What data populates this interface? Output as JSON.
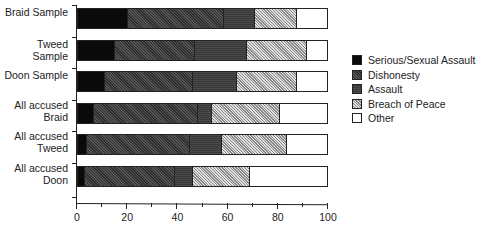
{
  "chart_data": {
    "type": "bar",
    "orientation": "horizontal",
    "stacked": true,
    "title": "",
    "xlabel": "",
    "ylabel": "",
    "xlim": [
      0,
      100
    ],
    "x_ticks": [
      "0",
      "20",
      "40",
      "60",
      "80",
      "100"
    ],
    "categories": [
      "Braid Sample",
      "Tweed Sample",
      "Doon Sample",
      "All accused\nBraid",
      "All accused\nTweed",
      "All accused\nDoon"
    ],
    "series": [
      {
        "name": "Serious/Sexual Assault",
        "values": [
          20,
          15,
          11,
          6.5,
          3.5,
          3
        ]
      },
      {
        "name": "Dishonesty",
        "values": [
          38.5,
          32,
          35,
          41.5,
          41.5,
          36
        ]
      },
      {
        "name": "Assault",
        "values": [
          12.5,
          21,
          18,
          6,
          13,
          7
        ]
      },
      {
        "name": "Breach of Peace",
        "values": [
          17,
          24,
          24,
          27,
          26,
          23
        ]
      },
      {
        "name": "Other",
        "values": [
          12,
          8,
          12,
          19,
          16,
          31
        ]
      }
    ],
    "legend_position": "right",
    "grid": false
  },
  "legend": [
    {
      "label": "Serious/Sexual Assault",
      "pattern": "p-serious"
    },
    {
      "label": "Dishonesty",
      "pattern": "p-dishonesty"
    },
    {
      "label": "Assault",
      "pattern": "p-assault"
    },
    {
      "label": "Breach of Peace",
      "pattern": "p-breach"
    },
    {
      "label": "Other",
      "pattern": "p-other"
    }
  ]
}
